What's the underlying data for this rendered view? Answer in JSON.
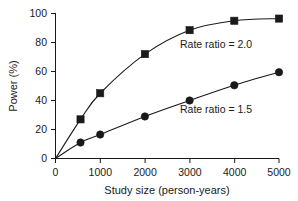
{
  "chart_data": {
    "type": "line",
    "title": "",
    "xlabel": "Study size (person-years)",
    "ylabel": "Power (%)",
    "xlim": [
      0,
      5000
    ],
    "ylim": [
      0,
      100
    ],
    "xticks": [
      0,
      1000,
      2000,
      3000,
      4000,
      5000
    ],
    "xtick_labels": [
      "0",
      "1000",
      "2000",
      "3000",
      "4000",
      "5000"
    ],
    "yticks": [
      0,
      20,
      40,
      60,
      80,
      100
    ],
    "ytick_labels": [
      "0",
      "20",
      "40",
      "60",
      "80",
      "100"
    ],
    "grid": false,
    "legend_position": "inline-annotations",
    "series": [
      {
        "name": "Rate ratio = 2.0",
        "marker": "square",
        "color": "#1a1a1a",
        "x": [
          0,
          560,
          1000,
          2000,
          3000,
          4000,
          5000
        ],
        "y": [
          0,
          27,
          45,
          72,
          88.5,
          95,
          96.5
        ]
      },
      {
        "name": "Rate ratio = 1.5",
        "marker": "circle",
        "color": "#1a1a1a",
        "x": [
          0,
          560,
          1000,
          2000,
          3000,
          4000,
          5000
        ],
        "y": [
          0,
          11,
          16.5,
          29,
          40,
          50.5,
          59.5
        ]
      }
    ],
    "annotations": [
      {
        "text": "Rate ratio = 2.0",
        "x": 2550,
        "y": 78
      },
      {
        "text": "Rate ratio = 1.5",
        "x": 2550,
        "y": 36
      }
    ]
  },
  "axes": {
    "y_title": "Power (%)",
    "x_title": "Study size (person-years)",
    "y_tick_0": "0",
    "y_tick_20": "20",
    "y_tick_40": "40",
    "y_tick_60": "60",
    "y_tick_80": "80",
    "y_tick_100": "100",
    "x_tick_0": "0",
    "x_tick_1000": "1000",
    "x_tick_2000": "2000",
    "x_tick_3000": "3000",
    "x_tick_4000": "4000",
    "x_tick_5000": "5000"
  },
  "annotations": {
    "upper": "Rate ratio = 2.0",
    "lower": "Rate ratio = 1.5"
  }
}
